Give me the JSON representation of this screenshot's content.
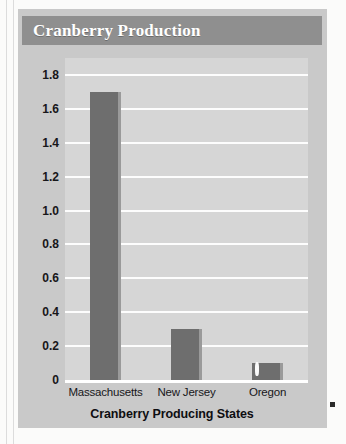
{
  "figure": {
    "title": "Cranberry Production"
  },
  "chart_data": {
    "type": "bar",
    "title": "Cranberry Production",
    "categories": [
      "Massachusetts",
      "New Jersey",
      "Oregon"
    ],
    "values": [
      1.7,
      0.3,
      0.1
    ],
    "xlabel": "Cranberry Producing States",
    "ylabel": "Barrels of Cranberries Harvested per Year (in millions)",
    "ylabel_main": "Barrels of Cranberries Harvested per Year",
    "ylabel_suffix": "(in millions)",
    "ylim": [
      0,
      1.9
    ],
    "yticks": [
      0,
      0.2,
      0.4,
      0.6,
      0.8,
      1.0,
      1.2,
      1.4,
      1.6,
      1.8
    ],
    "ytick_labels": [
      "0",
      "0.2",
      "0.4",
      "0.6",
      "0.8",
      "1.0",
      "1.2",
      "1.4",
      "1.6",
      "1.8"
    ],
    "grid": true,
    "legend": false,
    "bar_color": "#6e6e6e",
    "plot_background": "#d6d6d6",
    "gridline_color": "#fdfdfd",
    "title_banner_color": "#8f8f8f",
    "card_background": "#c9c9c9"
  }
}
